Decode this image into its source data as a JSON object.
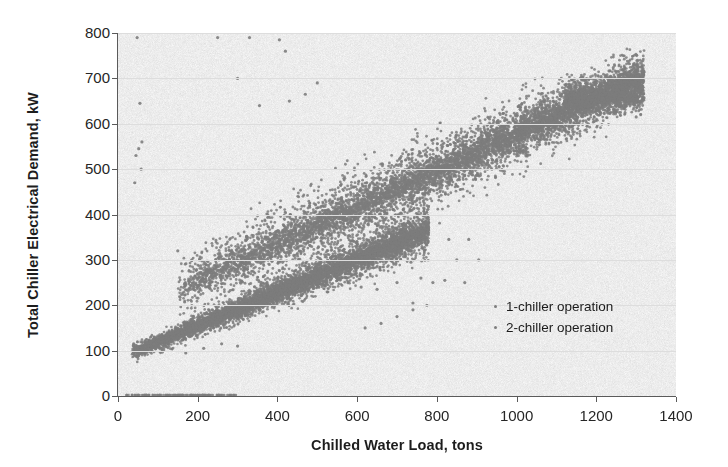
{
  "chart_data": {
    "type": "scatter",
    "title": "",
    "xlabel": "Chilled Water Load, tons",
    "ylabel": "Total Chiller Electrical Demand, kW",
    "xlim": [
      0,
      1400
    ],
    "ylim": [
      0,
      800
    ],
    "xticks": [
      0,
      200,
      400,
      600,
      800,
      1000,
      1200,
      1400
    ],
    "yticks": [
      0,
      100,
      200,
      300,
      400,
      500,
      600,
      700,
      800
    ],
    "grid": "horizontal-only-faint",
    "legend_position": "inside-lower-right",
    "plot_bg_color": "#ececec",
    "marker_color": "#7d7d7d",
    "marker_size_px": 3,
    "series": [
      {
        "name": "1-chiller operation",
        "description": "Lower band: single-chiller operation, roughly linear from (40 tons, 100 kW) rising to about (750 tons, 360 kW); slope ~0.37 kW/ton with scatter widening at higher loads.",
        "n_points": 4200,
        "x_range": [
          35,
          780
        ],
        "y_range": [
          95,
          370
        ],
        "fit_intercept_kw": 82,
        "fit_slope_kw_per_ton": 0.365,
        "y_scatter_sd_kw": 16
      },
      {
        "name": "2-chiller operation",
        "description": "Upper band: two-chiller operation, from about (170 tons, 240 kW) rising to about (1310 tons, 700 kW); slope ~0.40 kW/ton with wider vertical scatter.",
        "n_points": 5200,
        "x_range": [
          150,
          1320
        ],
        "y_range": [
          230,
          715
        ],
        "fit_intercept_kw": 175,
        "fit_slope_kw_per_ton": 0.402,
        "y_scatter_sd_kw": 26
      },
      {
        "name": "zero-demand points",
        "description": "A thin row of points lying on the y = 0 kW axis between roughly 20 and 300 tons (chillers off / metering zeros).",
        "n_points": 120,
        "x_range": [
          20,
          300
        ],
        "y_range": [
          0,
          0
        ]
      },
      {
        "name": "high outliers",
        "description": "Sparse outlier points: a near-vertical group just right of the y-axis at 460-790 kW for very low loads, a few isolated points at 650-790 kW between 250 and 450 tons, and scattered low points at 150-350 kW under the 2-chiller band between 550 and 900 tons.",
        "n_points": 60,
        "x_range": [
          20,
          900
        ],
        "y_range": [
          130,
          790
        ]
      }
    ],
    "annotations": []
  },
  "legend": {
    "items": [
      {
        "label": "1-chiller operation",
        "marker": "dot"
      },
      {
        "label": "2-chiller operation",
        "marker": "dot"
      }
    ]
  },
  "axes": {
    "x_title": "Chilled Water Load, tons",
    "y_title": "Total Chiller Electrical Demand, kW",
    "x_tick_labels": [
      "0",
      "200",
      "400",
      "600",
      "800",
      "1000",
      "1200",
      "1400"
    ],
    "y_tick_labels": [
      "0",
      "100",
      "200",
      "300",
      "400",
      "500",
      "600",
      "700",
      "800"
    ]
  }
}
